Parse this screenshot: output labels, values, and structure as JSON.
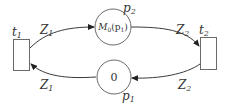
{
  "diagram": {
    "type": "petri-net",
    "transitions": [
      {
        "id": "t1",
        "label": "t",
        "sub": "1"
      },
      {
        "id": "t2",
        "label": "t",
        "sub": "2"
      }
    ],
    "places": [
      {
        "id": "p2",
        "label": "p",
        "sub": "2",
        "marking_main": "M",
        "marking_sub": "0",
        "marking_arg": "(p",
        "marking_arg_sub": "1",
        "marking_close": ")"
      },
      {
        "id": "p1",
        "label": "p",
        "sub": "1",
        "marking": "0"
      }
    ],
    "arcs": [
      {
        "from": "t1",
        "to": "p2",
        "label": "Z",
        "sub": "1"
      },
      {
        "from": "p2",
        "to": "t2",
        "label": "Z",
        "sub": "2"
      },
      {
        "from": "t2",
        "to": "p1",
        "label": "Z",
        "sub": "2"
      },
      {
        "from": "p1",
        "to": "t1",
        "label": "Z",
        "sub": "1"
      }
    ]
  }
}
